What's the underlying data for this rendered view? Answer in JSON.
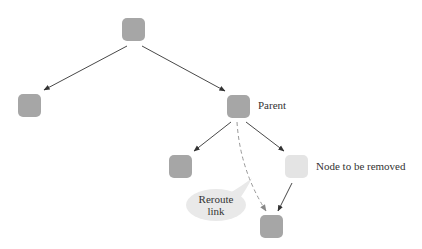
{
  "diagram": {
    "type": "binary-tree-node-removal",
    "colors": {
      "node": "#a6a6a6",
      "removed_node": "#e4e4e4",
      "edge": "#333333",
      "dashed_edge": "#999999",
      "bubble": "#e9e9e9"
    },
    "nodes": [
      {
        "id": "root",
        "x": 122,
        "y": 18,
        "label": ""
      },
      {
        "id": "left",
        "x": 18,
        "y": 94,
        "label": ""
      },
      {
        "id": "parent",
        "x": 227,
        "y": 95,
        "label": "Parent"
      },
      {
        "id": "parent-left",
        "x": 169,
        "y": 155,
        "label": ""
      },
      {
        "id": "removed",
        "x": 285,
        "y": 155,
        "label": "Node to be removed"
      },
      {
        "id": "grandchild",
        "x": 260,
        "y": 215,
        "label": ""
      }
    ],
    "edges": [
      {
        "from": "root",
        "to": "left",
        "style": "solid"
      },
      {
        "from": "root",
        "to": "parent",
        "style": "solid"
      },
      {
        "from": "parent",
        "to": "parent-left",
        "style": "solid"
      },
      {
        "from": "parent",
        "to": "removed",
        "style": "solid"
      },
      {
        "from": "removed",
        "to": "grandchild",
        "style": "solid"
      },
      {
        "from": "parent",
        "to": "grandchild",
        "style": "dashed"
      }
    ],
    "labels": {
      "parent": "Parent",
      "removed": "Node to be removed",
      "callout_line1": "Reroute",
      "callout_line2": "link"
    }
  }
}
